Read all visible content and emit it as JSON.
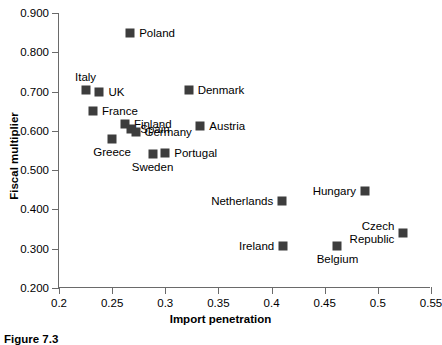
{
  "chart_data": {
    "type": "scatter",
    "title": "",
    "xlabel": "Import penetration",
    "ylabel": "Fiscal multiplier",
    "xlim": [
      0.2,
      0.55
    ],
    "ylim": [
      0.2,
      0.9
    ],
    "xticks": [
      "0.2",
      "0.25",
      "0.3",
      "0.35",
      "0.4",
      "0.45",
      "0.5",
      "0.55"
    ],
    "xtick_values": [
      0.2,
      0.25,
      0.3,
      0.35,
      0.4,
      0.45,
      0.5,
      0.55
    ],
    "yticks": [
      "0.200",
      "0.300",
      "0.400",
      "0.500",
      "0.600",
      "0.700",
      "0.800",
      "0.900"
    ],
    "ytick_values": [
      0.2,
      0.3,
      0.4,
      0.5,
      0.6,
      0.7,
      0.8,
      0.9
    ],
    "grid": false,
    "legend": false,
    "marker": "square",
    "marker_color": "#3d3d3d",
    "points": [
      {
        "name": "Poland",
        "x": 0.267,
        "y": 0.85,
        "label_pos": "right"
      },
      {
        "name": "Italy",
        "x": 0.225,
        "y": 0.703,
        "label_pos": "above"
      },
      {
        "name": "UK",
        "x": 0.238,
        "y": 0.699,
        "label_pos": "right"
      },
      {
        "name": "Denmark",
        "x": 0.322,
        "y": 0.703,
        "label_pos": "right"
      },
      {
        "name": "France",
        "x": 0.232,
        "y": 0.65,
        "label_pos": "right"
      },
      {
        "name": "Finland",
        "x": 0.262,
        "y": 0.617,
        "label_pos": "right"
      },
      {
        "name": "Spain",
        "x": 0.268,
        "y": 0.606,
        "label_pos": "right"
      },
      {
        "name": "Germany",
        "x": 0.272,
        "y": 0.597,
        "label_pos": "right"
      },
      {
        "name": "Austria",
        "x": 0.333,
        "y": 0.613,
        "label_pos": "right"
      },
      {
        "name": "Greece",
        "x": 0.25,
        "y": 0.58,
        "label_pos": "below"
      },
      {
        "name": "Sweden",
        "x": 0.288,
        "y": 0.541,
        "label_pos": "below"
      },
      {
        "name": "Portugal",
        "x": 0.3,
        "y": 0.544,
        "label_pos": "right"
      },
      {
        "name": "Netherlands",
        "x": 0.41,
        "y": 0.422,
        "label_pos": "left"
      },
      {
        "name": "Hungary",
        "x": 0.488,
        "y": 0.446,
        "label_pos": "left"
      },
      {
        "name": "Ireland",
        "x": 0.411,
        "y": 0.306,
        "label_pos": "left"
      },
      {
        "name": "Belgium",
        "x": 0.462,
        "y": 0.306,
        "label_pos": "below"
      },
      {
        "name": "Czech Republic",
        "x": 0.524,
        "y": 0.341,
        "label_pos": "left2"
      }
    ]
  },
  "caption": {
    "figure_number": "Figure 7.3"
  }
}
